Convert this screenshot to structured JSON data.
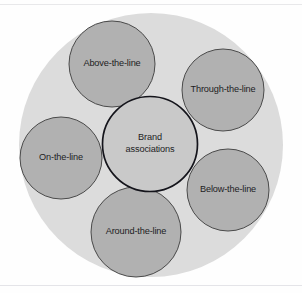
{
  "figure": {
    "type": "venn-cluster-diagram",
    "title": "Brand associations",
    "background_color": "#ffffff"
  },
  "colors": {
    "outer_circle_fill": "#dcdcdc",
    "satellite_fill": "#b1b1b1",
    "satellite_stroke": "#4a4a4a",
    "center_fill": "#c9c9c9",
    "center_stroke": "#14141b",
    "label_text": "#1d1d1f",
    "rule_line": "#e8e8ea"
  },
  "outer_circle": {
    "name": "outer-container-circle",
    "cx": 151,
    "cy": 145,
    "r": 132,
    "label": ""
  },
  "center_node": {
    "name": "brand-associations-node",
    "label_line_1": "Brand",
    "label_line_2": "associations",
    "cx": 150,
    "cy": 144,
    "r": 47.5
  },
  "satellite_nodes": [
    {
      "name": "above-the-line-node",
      "label": "Above-the-line",
      "cx": 112,
      "cy": 64,
      "r": 43
    },
    {
      "name": "through-the-line-node",
      "label": "Through-the-line",
      "cx": 223,
      "cy": 90,
      "r": 41
    },
    {
      "name": "below-the-line-node",
      "label": "Below-the-line",
      "cx": 228,
      "cy": 190,
      "r": 41
    },
    {
      "name": "around-the-line-node",
      "label": "Around-the-line",
      "cx": 136,
      "cy": 232,
      "r": 45
    },
    {
      "name": "on-the-line-node",
      "label": "On-the-line",
      "cx": 61,
      "cy": 158,
      "r": 41
    }
  ]
}
